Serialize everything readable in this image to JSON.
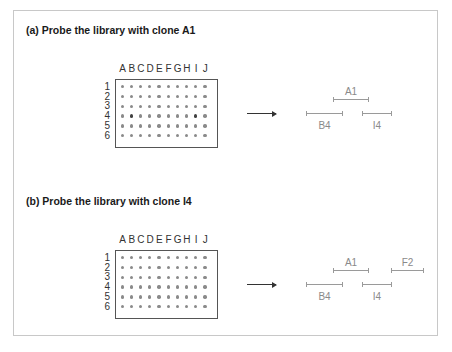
{
  "panels": [
    {
      "title": "(a) Probe the library with clone A1",
      "probe": "A1",
      "columns": [
        "A",
        "B",
        "C",
        "D",
        "E",
        "F",
        "G",
        "H",
        "I",
        "J"
      ],
      "rows": [
        "1",
        "2",
        "3",
        "4",
        "5",
        "6"
      ],
      "hybridized_wells": [
        "B4",
        "I4"
      ],
      "segments": [
        {
          "label": "A1",
          "x1": 333,
          "x2": 369,
          "y": 99,
          "label_y": 86
        },
        {
          "label": "B4",
          "x1": 306,
          "x2": 343,
          "y": 113,
          "label_y": 120
        },
        {
          "label": "I4",
          "x1": 362,
          "x2": 392,
          "y": 113,
          "label_y": 120
        }
      ]
    },
    {
      "title": "(b) Probe the library with clone I4",
      "probe": "I4",
      "columns": [
        "A",
        "B",
        "C",
        "D",
        "E",
        "F",
        "G",
        "H",
        "I",
        "J"
      ],
      "rows": [
        "1",
        "2",
        "3",
        "4",
        "5",
        "6"
      ],
      "hybridized_wells": [],
      "segments": [
        {
          "label": "A1",
          "x1": 333,
          "x2": 369,
          "y": 270,
          "label_y": 257
        },
        {
          "label": "F2",
          "x1": 391,
          "x2": 424,
          "y": 270,
          "label_y": 257
        },
        {
          "label": "B4",
          "x1": 306,
          "x2": 343,
          "y": 284,
          "label_y": 291
        },
        {
          "label": "I4",
          "x1": 362,
          "x2": 392,
          "y": 284,
          "label_y": 291
        }
      ]
    }
  ],
  "colors": {
    "frame": "#c8c8c8",
    "dot": "#8a8a8a",
    "dot_hit": "#404040",
    "segment": "#9a9a9a"
  }
}
